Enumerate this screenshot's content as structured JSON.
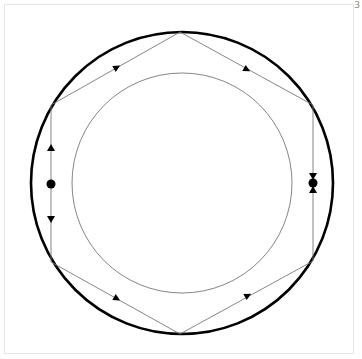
{
  "page": {
    "number": "3"
  },
  "diagram": {
    "colors": {
      "outer_circle": "#000000",
      "inner_circle": "#666666",
      "hexagon": "#777777",
      "marker": "#000000"
    },
    "outer_circle": {
      "cx": 182,
      "cy": 183,
      "r": 151
    },
    "inner_circle": {
      "cx": 182,
      "cy": 183,
      "r": 110
    },
    "hexagon": {
      "vertices": [
        [
          180,
          32
        ],
        [
          313,
          105
        ],
        [
          313,
          261
        ],
        [
          180,
          334
        ],
        [
          51,
          262
        ],
        [
          51,
          105
        ]
      ]
    },
    "fixed_points": [
      {
        "name": "left",
        "x": 51,
        "y": 184,
        "type": "source"
      },
      {
        "name": "right",
        "x": 313,
        "y": 183,
        "type": "sink"
      }
    ],
    "arrows": [
      {
        "edge": "upper-left",
        "x": 114,
        "y": 69,
        "direction": "toward-top-vertex"
      },
      {
        "edge": "upper-right",
        "x": 244,
        "y": 68,
        "direction": "toward-right-vertex"
      },
      {
        "edge": "lower-left",
        "x": 114,
        "y": 297,
        "direction": "toward-bottom-vertex"
      },
      {
        "edge": "lower-right",
        "x": 245,
        "y": 297,
        "direction": "toward-right-vertex"
      },
      {
        "edge": "left-upper",
        "x": 51,
        "y": 147,
        "direction": "up"
      },
      {
        "edge": "left-lower",
        "x": 51,
        "y": 220,
        "direction": "down"
      },
      {
        "edge": "right-upper",
        "x": 313,
        "y": 177,
        "direction": "down"
      },
      {
        "edge": "right-lower",
        "x": 313,
        "y": 189,
        "direction": "up"
      }
    ]
  }
}
